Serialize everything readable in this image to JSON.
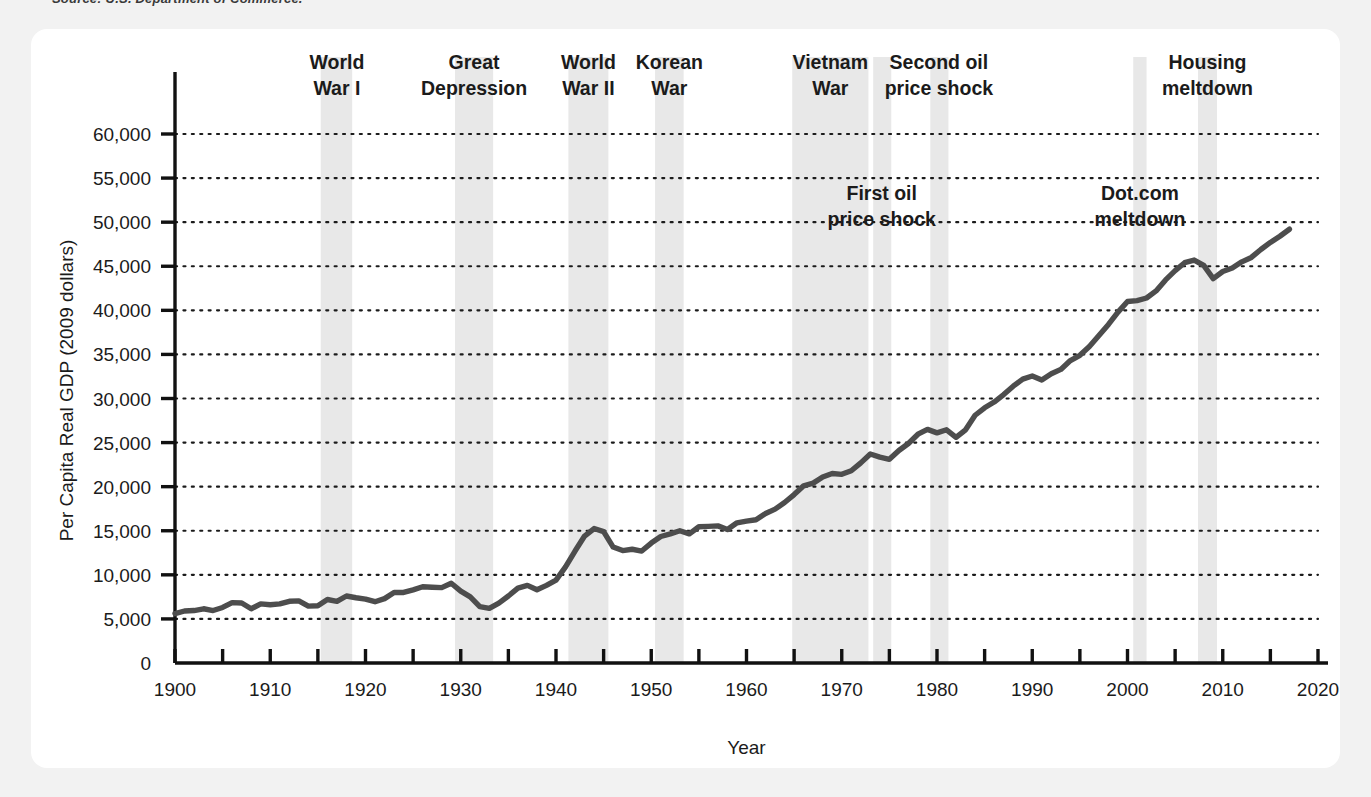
{
  "source_note": "Source: U.S. Department of Commerce.",
  "chart_data": {
    "type": "line",
    "title": "",
    "xlabel": "Year",
    "ylabel": "Per Capita Real GDP (2009 dollars)",
    "xlim": [
      1900,
      2020
    ],
    "ylim": [
      0,
      62000
    ],
    "grid": true,
    "legend": "none",
    "x_ticks": [
      "1900",
      "1910",
      "1920",
      "1930",
      "1940",
      "1950",
      "1960",
      "1970",
      "1980",
      "1990",
      "2000",
      "2010",
      "2020"
    ],
    "x_tick_values": [
      1900,
      1910,
      1920,
      1930,
      1940,
      1950,
      1960,
      1970,
      1980,
      1990,
      2000,
      2010,
      2020
    ],
    "x_minor_step": 5,
    "y_ticks": [
      "0",
      "5,000",
      "10,000",
      "15,000",
      "20,000",
      "25,000",
      "30,000",
      "35,000",
      "40,000",
      "45,000",
      "50,000",
      "55,000",
      "60,000"
    ],
    "y_tick_values": [
      0,
      5000,
      10000,
      15000,
      20000,
      25000,
      30000,
      35000,
      40000,
      45000,
      50000,
      55000,
      60000
    ],
    "line_color": "#4d4d4d",
    "band_color": "#e8e8e8",
    "series": [
      {
        "name": "Per Capita Real GDP",
        "x": [
          1900,
          1901,
          1902,
          1903,
          1904,
          1905,
          1906,
          1907,
          1908,
          1909,
          1910,
          1911,
          1912,
          1913,
          1914,
          1915,
          1916,
          1917,
          1918,
          1919,
          1920,
          1921,
          1922,
          1923,
          1924,
          1925,
          1926,
          1927,
          1928,
          1929,
          1930,
          1931,
          1932,
          1933,
          1934,
          1935,
          1936,
          1937,
          1938,
          1939,
          1940,
          1941,
          1942,
          1943,
          1944,
          1945,
          1946,
          1947,
          1948,
          1949,
          1950,
          1951,
          1952,
          1953,
          1954,
          1955,
          1956,
          1957,
          1958,
          1959,
          1960,
          1961,
          1962,
          1963,
          1964,
          1965,
          1966,
          1967,
          1968,
          1969,
          1970,
          1971,
          1972,
          1973,
          1974,
          1975,
          1976,
          1977,
          1978,
          1979,
          1980,
          1981,
          1982,
          1983,
          1984,
          1985,
          1986,
          1987,
          1988,
          1989,
          1990,
          1991,
          1992,
          1993,
          1994,
          1995,
          1996,
          1997,
          1998,
          1999,
          2000,
          2001,
          2002,
          2003,
          2004,
          2005,
          2006,
          2007,
          2008,
          2009,
          2010,
          2011,
          2012,
          2013,
          2014,
          2015,
          2016,
          2017
        ],
        "values": [
          5600,
          5900,
          5950,
          6150,
          5950,
          6300,
          6850,
          6800,
          6150,
          6700,
          6600,
          6700,
          7000,
          7050,
          6450,
          6500,
          7200,
          7000,
          7600,
          7400,
          7250,
          6950,
          7300,
          8000,
          8000,
          8300,
          8650,
          8600,
          8550,
          9050,
          8150,
          7500,
          6400,
          6200,
          6800,
          7600,
          8500,
          8800,
          8300,
          8800,
          9400,
          10900,
          12700,
          14400,
          15250,
          14900,
          13150,
          12750,
          12900,
          12700,
          13600,
          14350,
          14650,
          15000,
          14650,
          15450,
          15500,
          15550,
          15150,
          15900,
          16100,
          16250,
          16950,
          17450,
          18200,
          19100,
          20100,
          20400,
          21100,
          21500,
          21400,
          21800,
          22700,
          23700,
          23350,
          23100,
          24100,
          24900,
          25950,
          26500,
          26100,
          26450,
          25600,
          26450,
          28100,
          28950,
          29600,
          30450,
          31400,
          32200,
          32550,
          32100,
          32800,
          33300,
          34300,
          34900,
          35900,
          37150,
          38400,
          39800,
          41000,
          41100,
          41400,
          42200,
          43450,
          44500,
          45400,
          45700,
          45100,
          43600,
          44400,
          44800,
          45500,
          46000,
          46900,
          47700,
          48400,
          49200
        ]
      }
    ],
    "shaded_events": [
      {
        "label": "World War I",
        "label_lines": [
          "World",
          "War I"
        ],
        "start": 1915.3,
        "end": 1918.6,
        "label_x": 1917,
        "label_pos": "top"
      },
      {
        "label": "Great Depression",
        "label_lines": [
          "Great",
          "Depression"
        ],
        "start": 1929.4,
        "end": 1933.4,
        "label_x": 1931.4,
        "label_pos": "top"
      },
      {
        "label": "World War II",
        "label_lines": [
          "World",
          "War II"
        ],
        "start": 1941.3,
        "end": 1945.5,
        "label_x": 1943.4,
        "label_pos": "top"
      },
      {
        "label": "Korean War",
        "label_lines": [
          "Korean",
          "War"
        ],
        "start": 1950.4,
        "end": 1953.4,
        "label_x": 1951.9,
        "label_pos": "top"
      },
      {
        "label": "Vietnam War",
        "label_lines": [
          "Vietnam",
          "War"
        ],
        "start": 1964.8,
        "end": 1972.8,
        "label_x": 1968.8,
        "label_pos": "top"
      },
      {
        "label": "First oil price shock",
        "label_lines": [
          "First oil",
          "price shock"
        ],
        "start": 1973.3,
        "end": 1975.2,
        "label_x": 1974.2,
        "label_pos": "inner"
      },
      {
        "label": "Second oil price shock",
        "label_lines": [
          "Second oil",
          "price shock"
        ],
        "start": 1979.3,
        "end": 1981.2,
        "label_x": 1980.2,
        "label_pos": "top"
      },
      {
        "label": "Dot.com meltdown",
        "label_lines": [
          "Dot.com",
          "meltdown"
        ],
        "start": 2000.6,
        "end": 2002.0,
        "label_x": 2001.3,
        "label_pos": "inner"
      },
      {
        "label": "Housing meltdown",
        "label_lines": [
          "Housing",
          "meltdown"
        ],
        "start": 2007.4,
        "end": 2009.4,
        "label_x": 2008.4,
        "label_pos": "top"
      }
    ]
  }
}
